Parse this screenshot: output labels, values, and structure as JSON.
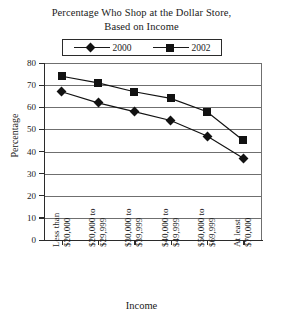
{
  "chart_data": {
    "type": "line",
    "title": "Percentage Who Shop at the Dollar Store, Based on Income",
    "title_lines": [
      "Percentage Who Shop at the Dollar Store,",
      "Based on Income"
    ],
    "xlabel": "Income",
    "ylabel": "Percentage",
    "categories": [
      "Less than $20,000",
      "$20,000 to $29,999",
      "$30,000 to $39,999",
      "$40,000 to $49,999",
      "$50,000 to $69,999",
      "At least $70,000"
    ],
    "category_lines": [
      [
        "Less than",
        "$20,000"
      ],
      [
        "$20,000 to",
        "$29,999"
      ],
      [
        "$30,000 to",
        "$39,999"
      ],
      [
        "$40,000 to",
        "$49,999"
      ],
      [
        "$50,000 to",
        "$69,999"
      ],
      [
        "At least",
        "$70,000"
      ]
    ],
    "series": [
      {
        "name": "2000",
        "marker": "diamond",
        "color": "#121212",
        "values": [
          67,
          62,
          58,
          54,
          47,
          37
        ]
      },
      {
        "name": "2002",
        "marker": "square",
        "color": "#121212",
        "values": [
          74,
          71,
          67,
          64,
          58,
          45
        ]
      }
    ],
    "ylim": [
      0,
      80
    ],
    "ytick_step": 10,
    "yticks": [
      80,
      70,
      60,
      50,
      40,
      30,
      20,
      10,
      0
    ],
    "grid": true,
    "grid_axis": "y",
    "legend_position": "top-center",
    "legend_entries": [
      "2000",
      "2002"
    ]
  },
  "legend": {
    "entries": [
      {
        "label": "2000",
        "marker_name": "legend-marker-diamond-2000"
      },
      {
        "label": "2002",
        "marker_name": "legend-marker-square-2002"
      }
    ]
  }
}
